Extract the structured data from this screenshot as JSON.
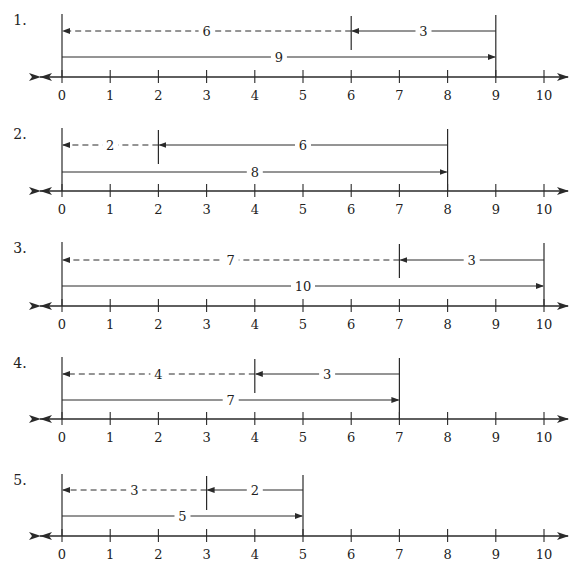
{
  "colors": {
    "ink": "#2a2a2a",
    "background": "#ffffff"
  },
  "axis": {
    "ticks": [
      0,
      1,
      2,
      3,
      4,
      5,
      6,
      7,
      8,
      9,
      10
    ],
    "tick_labels": [
      "0",
      "1",
      "2",
      "3",
      "4",
      "5",
      "6",
      "7",
      "8",
      "9",
      "10"
    ],
    "x0_px": 62,
    "unit_px": 48.2
  },
  "problems": [
    {
      "label": "1.",
      "total": 9,
      "subtract": 3,
      "result": 6,
      "total_label": "9",
      "subtract_label": "3",
      "result_label": "6",
      "top_y": 14,
      "arrow_top_y": 31,
      "arrow_bottom_y": 57,
      "axis_y": 77
    },
    {
      "label": "2.",
      "total": 8,
      "subtract": 6,
      "result": 2,
      "total_label": "8",
      "subtract_label": "6",
      "result_label": "2",
      "top_y": 128,
      "arrow_top_y": 145,
      "arrow_bottom_y": 172,
      "axis_y": 191
    },
    {
      "label": "3.",
      "total": 10,
      "subtract": 3,
      "result": 7,
      "total_label": "10",
      "subtract_label": "3",
      "result_label": "7",
      "top_y": 242,
      "arrow_top_y": 260,
      "arrow_bottom_y": 286,
      "axis_y": 306
    },
    {
      "label": "4.",
      "total": 7,
      "subtract": 3,
      "result": 4,
      "total_label": "7",
      "subtract_label": "3",
      "result_label": "4",
      "top_y": 357,
      "arrow_top_y": 374,
      "arrow_bottom_y": 400,
      "axis_y": 419
    },
    {
      "label": "5.",
      "total": 5,
      "subtract": 2,
      "result": 3,
      "total_label": "5",
      "subtract_label": "2",
      "result_label": "3",
      "top_y": 474,
      "arrow_top_y": 490,
      "arrow_bottom_y": 516,
      "axis_y": 536
    }
  ]
}
